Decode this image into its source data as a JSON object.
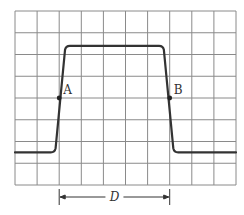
{
  "figure": {
    "type": "oscilloscope-pulse-waveform",
    "grid": {
      "columns": 10,
      "rows": 8,
      "line_color": "#8a8a8a",
      "x_left": 15,
      "x_right": 236,
      "y_top": 11,
      "y_bottom": 185
    },
    "waveform": {
      "color": "#333333",
      "description": "single rectangular pulse with finite rise and fall times",
      "baseline_division_from_top": 6.5,
      "top_division_from_top": 1.6,
      "rise_start_division": 1.8,
      "rise_end_division": 2.3,
      "fall_start_division": 6.7,
      "fall_end_division": 7.2
    },
    "points": [
      {
        "label": "A",
        "division_x": 2,
        "division_y": 4,
        "note": "50% amplitude on leading edge"
      },
      {
        "label": "B",
        "division_x": 7,
        "division_y": 4,
        "note": "50% amplitude on trailing edge"
      }
    ],
    "dimension": {
      "label": "D",
      "from_point": "A",
      "to_point": "B",
      "span_divisions": 5
    }
  }
}
